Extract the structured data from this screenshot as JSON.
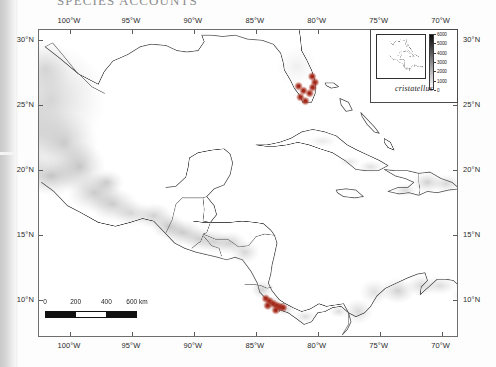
{
  "page": {
    "running_head": "SPECIES ACCOUNTS"
  },
  "figure": {
    "type": "distribution-map",
    "species_label": "cristatellus",
    "projection_note": "equirectangular"
  },
  "axes": {
    "longitude_labels": [
      "100°W",
      "95°W",
      "90°W",
      "85°W",
      "80°W",
      "75°W",
      "70°W"
    ],
    "longitude_values": [
      -100,
      -95,
      -90,
      -85,
      -80,
      -75,
      -70
    ],
    "latitude_labels": [
      "30°N",
      "25°N",
      "20°N",
      "15°N",
      "10°N"
    ],
    "latitude_values": [
      30,
      25,
      20,
      15,
      10
    ],
    "xlim": [
      -102.5,
      -68.6
    ],
    "ylim": [
      7.1,
      30.8
    ]
  },
  "scalebar": {
    "labels": [
      "0",
      "200",
      "400",
      "600 km"
    ],
    "values": [
      0,
      200,
      400,
      600
    ],
    "unit": "km",
    "segments": [
      "dark",
      "light",
      "dark"
    ]
  },
  "inset": {
    "species": "cristatellus",
    "elevation_legend": {
      "title": "",
      "labels": [
        "6000",
        "5000",
        "4000",
        "3000",
        "2000",
        "1000",
        "0"
      ],
      "values": [
        6000,
        5000,
        4000,
        3000,
        2000,
        1000,
        0
      ],
      "unit": "m"
    }
  },
  "chart_data": {
    "type": "map",
    "title": "",
    "xlabel": "",
    "ylabel": "",
    "xlim": [
      -102.5,
      -68.6
    ],
    "ylim": [
      7.1,
      30.8
    ],
    "grid": false,
    "legend_position": "inset-top-right",
    "basemap": {
      "shading": "grayscale hillshade / elevation",
      "coastlines": true,
      "country_borders": true
    },
    "series": [
      {
        "name": "cristatellus occurrence",
        "color": "#a32718",
        "type": "point-cluster",
        "points": [
          {
            "lon": -80.35,
            "lat": 27.2
          },
          {
            "lon": -80.12,
            "lat": 26.75
          },
          {
            "lon": -80.3,
            "lat": 26.35
          },
          {
            "lon": -80.55,
            "lat": 25.9
          },
          {
            "lon": -81.05,
            "lat": 26.1
          },
          {
            "lon": -81.45,
            "lat": 26.45
          },
          {
            "lon": -81.3,
            "lat": 25.6
          },
          {
            "lon": -80.9,
            "lat": 25.3
          },
          {
            "lon": -84.1,
            "lat": 10.0
          },
          {
            "lon": -83.8,
            "lat": 9.8
          },
          {
            "lon": -83.5,
            "lat": 9.6
          },
          {
            "lon": -83.2,
            "lat": 9.45
          },
          {
            "lon": -82.95,
            "lat": 9.35
          },
          {
            "lon": -82.7,
            "lat": 9.3
          },
          {
            "lon": -83.95,
            "lat": 9.45
          },
          {
            "lon": -83.3,
            "lat": 9.1
          }
        ]
      }
    ]
  }
}
